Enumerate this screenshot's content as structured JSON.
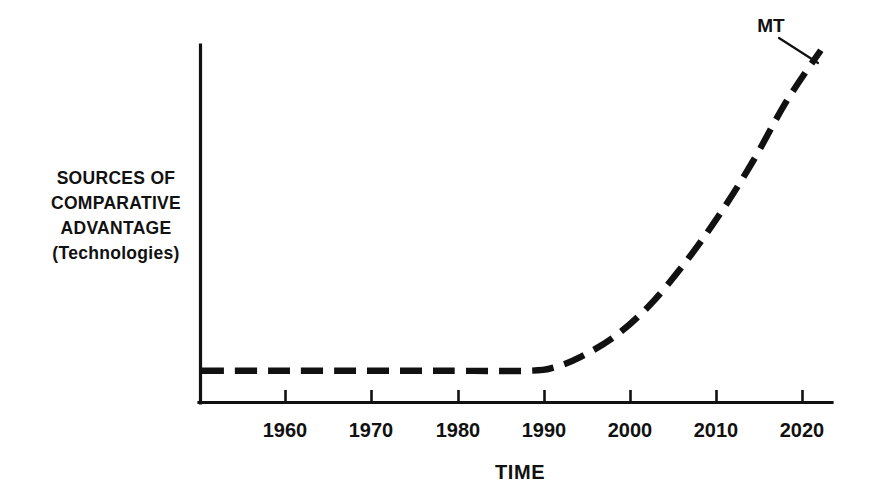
{
  "chart_data": {
    "type": "line",
    "title": "",
    "subtitle": "",
    "xlabel": "TIME",
    "ylabel": "SOURCES OF COMPARATIVE ADVANTAGE (Technologies)",
    "ylabel_lines": [
      "SOURCES OF",
      "COMPARATIVE",
      "ADVANTAGE",
      "(Technologies)"
    ],
    "xticks": [
      1960,
      1970,
      1980,
      1990,
      2000,
      2010,
      2020
    ],
    "xtick_labels": [
      "1960",
      "1970",
      "1980",
      "1990",
      "2000",
      "2010",
      "2020"
    ],
    "xlim": [
      1952,
      2026
    ],
    "ylim": [
      0,
      100
    ],
    "yticks": [],
    "ytick_labels": [],
    "grid": false,
    "legend": false,
    "line_style": "dashed",
    "line_color": "#111111",
    "axis_color": "#111111",
    "background_color": "#ffffff",
    "series": [
      {
        "name": "MT",
        "style": "dashed",
        "x": [
          1952,
          1960,
          1970,
          1980,
          1990,
          1993,
          1996,
          2000,
          2004,
          2008,
          2012,
          2016,
          2020,
          2024
        ],
        "y": [
          3,
          3,
          3,
          3,
          3,
          4,
          7,
          13,
          22,
          34,
          48,
          64,
          82,
          97
        ]
      }
    ],
    "annotations": [
      {
        "label": "MT",
        "target_x": 2021,
        "target_y": 90,
        "description": "leader line pointing to upper end of exponential dashed curve"
      }
    ]
  },
  "figure": {
    "x_axis_name": "time-axis",
    "y_axis_name": "sources-of-comparative-advantage-axis"
  }
}
